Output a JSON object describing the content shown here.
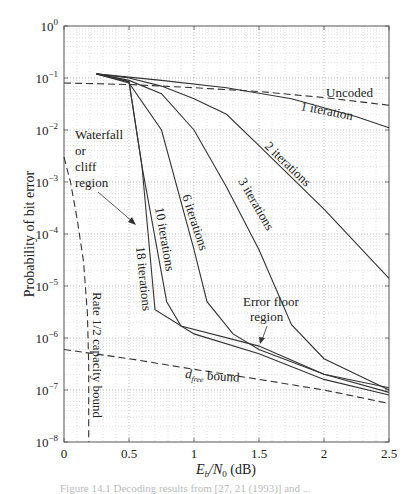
{
  "chart_data": {
    "type": "line",
    "title": "",
    "xlabel": "E_b/N_0 (dB)",
    "ylabel": "Probability of bit error",
    "xlim": [
      0,
      2.5
    ],
    "ylim": [
      1e-08,
      1
    ],
    "yscale": "log",
    "grid": true,
    "x_ticks": [
      "0",
      "0.5",
      "1",
      "1.5",
      "2",
      "2.5"
    ],
    "y_ticks": [
      "10^0",
      "10^-1",
      "10^-2",
      "10^-3",
      "10^-4",
      "10^-5",
      "10^-6",
      "10^-7",
      "10^-8"
    ],
    "series": [
      {
        "name": "Uncoded",
        "style": "dashed",
        "x": [
          0,
          0.5,
          1.0,
          1.5,
          2.0,
          2.5
        ],
        "values": [
          0.08,
          0.075,
          0.065,
          0.055,
          0.042,
          0.03
        ]
      },
      {
        "name": "1 iteration",
        "style": "solid",
        "x": [
          0.25,
          0.75,
          1.25,
          1.75,
          2.25,
          2.5
        ],
        "values": [
          0.12,
          0.09,
          0.065,
          0.04,
          0.018,
          0.011
        ]
      },
      {
        "name": "2 iterations",
        "style": "solid",
        "x": [
          0.25,
          0.5,
          0.75,
          1.0,
          1.25,
          1.5,
          2.0,
          2.5
        ],
        "values": [
          0.12,
          0.1,
          0.07,
          0.04,
          0.02,
          0.005,
          0.0003,
          1.4e-05
        ]
      },
      {
        "name": "3 iterations",
        "style": "solid",
        "x": [
          0.25,
          0.5,
          0.75,
          1.0,
          1.25,
          1.5,
          1.75,
          2.0,
          2.5
        ],
        "values": [
          0.12,
          0.09,
          0.05,
          0.01,
          0.0008,
          5e-05,
          1.8e-06,
          4e-07,
          1e-07
        ]
      },
      {
        "name": "6 iterations",
        "style": "solid",
        "x": [
          0.25,
          0.5,
          0.75,
          1.0,
          1.1,
          1.3,
          1.5,
          2.0,
          2.5
        ],
        "values": [
          0.12,
          0.08,
          0.01,
          5e-05,
          5e-06,
          1.2e-06,
          6e-07,
          2e-07,
          9e-08
        ]
      },
      {
        "name": "10 iterations",
        "style": "solid",
        "x": [
          0.25,
          0.5,
          0.6,
          0.79,
          0.9,
          1.5,
          2.0,
          2.5
        ],
        "values": [
          0.12,
          0.085,
          0.002,
          5e-06,
          1.7e-06,
          7e-07,
          2e-07,
          1.1e-07
        ]
      },
      {
        "name": "18 iterations",
        "style": "solid",
        "x": [
          0.25,
          0.5,
          0.6,
          0.7,
          1.0,
          1.5,
          2.0,
          2.5
        ],
        "values": [
          0.12,
          0.085,
          0.002,
          3.5e-06,
          1.2e-06,
          5e-07,
          1.6e-07,
          8e-08
        ]
      },
      {
        "name": "d_free bound",
        "style": "dashed",
        "x": [
          0,
          0.5,
          1.0,
          1.5,
          2.0,
          2.5
        ],
        "values": [
          6e-07,
          4e-07,
          2.5e-07,
          1.6e-07,
          1e-07,
          5.5e-08
        ]
      },
      {
        "name": "Rate 1/2 capacity bound",
        "style": "dashed",
        "x": [
          0,
          0.05,
          0.1,
          0.15,
          0.18,
          0.19,
          0.19
        ],
        "values": [
          0.003,
          0.001,
          0.0002,
          3e-05,
          3e-06,
          3e-07,
          1e-08
        ]
      }
    ],
    "annotations": [
      {
        "text": "Uncoded",
        "x": 2.2,
        "y": 0.08
      },
      {
        "text": "1 iteration",
        "x": 2.0,
        "y": 0.025
      },
      {
        "text": "2 iterations",
        "x": 1.65,
        "y": 0.003
      },
      {
        "text": "3 iterations",
        "x": 1.35,
        "y": 0.0003
      },
      {
        "text": "6 iterations",
        "x": 0.95,
        "y": 0.0002
      },
      {
        "text": "10 iterations",
        "x": 0.75,
        "y": 5e-05
      },
      {
        "text": "18 iterations",
        "x": 0.55,
        "y": 1.5e-05
      },
      {
        "text": "Waterfall or cliff region",
        "x": 0.1,
        "y": 0.01
      },
      {
        "text": "Error floor region",
        "x": 1.4,
        "y": 2e-06
      },
      {
        "text": "d_free bound",
        "x": 0.9,
        "y": 1.5e-07
      },
      {
        "text": "Rate 1/2 capacity bound",
        "x": 0.25,
        "y": 1e-06
      }
    ]
  },
  "labels": {
    "ylabel": "Probability of bit error",
    "xlabel_E": "E",
    "xlabel_b": "b",
    "xlabel_N": "/N",
    "xlabel_0": "0",
    "xlabel_unit": " (dB)",
    "uncoded": "Uncoded",
    "iter1": "1 iteration",
    "iter2": "2 iterations",
    "iter3": "3 iterations",
    "iter6": "6 iterations",
    "iter10": "10 iterations",
    "iter18": "18 iterations",
    "waterfall1": "Waterfall",
    "waterfall2": "or",
    "waterfall3": "cliff",
    "waterfall4": "region",
    "floor1": "Error floor",
    "floor2": "region",
    "dfree_d": "d",
    "dfree_sub": "free",
    "dfree_rest": " bound",
    "capacity": "Rate 1/2 capacity bound",
    "caption": "Figure 14.1  Decoding results from [27, 21 (1993)] and ..."
  }
}
